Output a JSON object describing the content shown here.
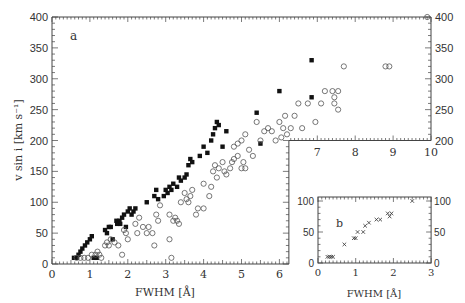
{
  "chart_data": [
    {
      "panel": "a",
      "type": "scatter",
      "xlabel": "FWHM [Å]",
      "ylabel": "v sin i [km s⁻¹]",
      "xlim": [
        0,
        10
      ],
      "ylim": [
        0,
        400
      ],
      "x_ticks": [
        0,
        1,
        2,
        3,
        4,
        5,
        6,
        7,
        8,
        9,
        10
      ],
      "y_ticks": [
        0,
        50,
        100,
        150,
        200,
        250,
        300,
        350,
        400
      ],
      "grid": false,
      "legend": null,
      "note": "Plot region is L-shaped: lower-left x 0–6.25 for y 0–400, upper-right x 6.25–10 for y 200–400",
      "series": [
        {
          "name": "filled squares",
          "marker": "filled-square",
          "points": [
            [
              0.58,
              10
            ],
            [
              0.65,
              10
            ],
            [
              0.7,
              15
            ],
            [
              0.75,
              20
            ],
            [
              0.8,
              25
            ],
            [
              0.87,
              30
            ],
            [
              0.93,
              35
            ],
            [
              1.0,
              40
            ],
            [
              1.05,
              45
            ],
            [
              1.1,
              10
            ],
            [
              1.18,
              10
            ],
            [
              1.4,
              55
            ],
            [
              1.45,
              50
            ],
            [
              1.5,
              60
            ],
            [
              1.55,
              60
            ],
            [
              1.6,
              40
            ],
            [
              1.7,
              70
            ],
            [
              1.72,
              65
            ],
            [
              1.78,
              70
            ],
            [
              1.8,
              65
            ],
            [
              1.85,
              75
            ],
            [
              1.9,
              80
            ],
            [
              1.95,
              60
            ],
            [
              2.0,
              85
            ],
            [
              2.05,
              90
            ],
            [
              2.1,
              80
            ],
            [
              2.15,
              85
            ],
            [
              2.2,
              90
            ],
            [
              2.5,
              100
            ],
            [
              2.7,
              110
            ],
            [
              2.75,
              120
            ],
            [
              2.8,
              105
            ],
            [
              2.95,
              110
            ],
            [
              3.0,
              120
            ],
            [
              3.05,
              115
            ],
            [
              3.1,
              125
            ],
            [
              3.15,
              120
            ],
            [
              3.2,
              130
            ],
            [
              3.3,
              125
            ],
            [
              3.35,
              140
            ],
            [
              3.4,
              135
            ],
            [
              3.5,
              140
            ],
            [
              3.55,
              145
            ],
            [
              3.6,
              160
            ],
            [
              3.65,
              170
            ],
            [
              3.7,
              165
            ],
            [
              3.9,
              175
            ],
            [
              4.0,
              190
            ],
            [
              4.1,
              180
            ],
            [
              4.2,
              200
            ],
            [
              4.25,
              210
            ],
            [
              4.3,
              220
            ],
            [
              4.35,
              230
            ],
            [
              4.4,
              225
            ],
            [
              4.5,
              190
            ],
            [
              4.6,
              215
            ],
            [
              5.4,
              245
            ],
            [
              5.5,
              195
            ],
            [
              6.0,
              280
            ],
            [
              6.85,
              330
            ],
            [
              6.85,
              270
            ]
          ]
        },
        {
          "name": "open circles",
          "marker": "open-circle",
          "points": [
            [
              0.65,
              10
            ],
            [
              0.75,
              10
            ],
            [
              0.85,
              10
            ],
            [
              0.95,
              10
            ],
            [
              1.05,
              15
            ],
            [
              1.15,
              15
            ],
            [
              1.2,
              20
            ],
            [
              1.25,
              15
            ],
            [
              1.3,
              10
            ],
            [
              1.4,
              30
            ],
            [
              1.45,
              35
            ],
            [
              1.5,
              30
            ],
            [
              1.55,
              40
            ],
            [
              1.65,
              35
            ],
            [
              1.75,
              30
            ],
            [
              1.85,
              15
            ],
            [
              1.9,
              55
            ],
            [
              1.95,
              50
            ],
            [
              2.0,
              40
            ],
            [
              2.2,
              65
            ],
            [
              2.25,
              50
            ],
            [
              2.3,
              75
            ],
            [
              2.4,
              60
            ],
            [
              2.5,
              50
            ],
            [
              2.55,
              60
            ],
            [
              2.65,
              50
            ],
            [
              2.7,
              30
            ],
            [
              2.75,
              80
            ],
            [
              2.8,
              70
            ],
            [
              2.85,
              95
            ],
            [
              3.1,
              80
            ],
            [
              3.1,
              40
            ],
            [
              3.15,
              10
            ],
            [
              3.2,
              70
            ],
            [
              3.25,
              75
            ],
            [
              3.3,
              70
            ],
            [
              3.35,
              65
            ],
            [
              3.4,
              100
            ],
            [
              3.5,
              115
            ],
            [
              3.55,
              105
            ],
            [
              3.6,
              100
            ],
            [
              3.65,
              110
            ],
            [
              3.7,
              120
            ],
            [
              3.8,
              80
            ],
            [
              3.85,
              90
            ],
            [
              4.0,
              90
            ],
            [
              4.0,
              130
            ],
            [
              4.15,
              110
            ],
            [
              4.2,
              125
            ],
            [
              4.25,
              150
            ],
            [
              4.3,
              160
            ],
            [
              4.35,
              140
            ],
            [
              4.4,
              155
            ],
            [
              4.5,
              165
            ],
            [
              4.55,
              150
            ],
            [
              4.6,
              145
            ],
            [
              4.7,
              155
            ],
            [
              4.75,
              165
            ],
            [
              4.8,
              170
            ],
            [
              4.9,
              175
            ],
            [
              5.0,
              155
            ],
            [
              5.05,
              165
            ],
            [
              5.1,
              155
            ],
            [
              4.8,
              190
            ],
            [
              4.9,
              195
            ],
            [
              5.0,
              200
            ],
            [
              5.1,
              210
            ],
            [
              5.2,
              185
            ],
            [
              5.3,
              175
            ],
            [
              5.4,
              230
            ],
            [
              5.5,
              200
            ],
            [
              5.6,
              215
            ],
            [
              5.7,
              220
            ],
            [
              5.8,
              215
            ],
            [
              5.9,
              200
            ],
            [
              6.0,
              230
            ],
            [
              6.05,
              205
            ],
            [
              6.1,
              220
            ],
            [
              6.15,
              240
            ],
            [
              6.2,
              210
            ],
            [
              6.3,
              220
            ],
            [
              6.4,
              240
            ],
            [
              6.5,
              260
            ],
            [
              6.6,
              220
            ],
            [
              6.75,
              260
            ],
            [
              6.95,
              230
            ],
            [
              7.1,
              260
            ],
            [
              7.2,
              280
            ],
            [
              7.4,
              280
            ],
            [
              7.45,
              270
            ],
            [
              7.45,
              260
            ],
            [
              7.55,
              280
            ],
            [
              7.55,
              250
            ],
            [
              7.7,
              320
            ],
            [
              8.8,
              320
            ],
            [
              8.9,
              320
            ],
            [
              9.9,
              400
            ]
          ]
        }
      ]
    },
    {
      "panel": "b",
      "type": "scatter",
      "xlabel": "FWHM [Å]",
      "ylabel": "",
      "xlim": [
        0,
        3
      ],
      "ylim": [
        0,
        110
      ],
      "x_ticks": [
        0,
        1,
        2,
        3
      ],
      "y_ticks": [
        0,
        50,
        100
      ],
      "grid": false,
      "legend": null,
      "series": [
        {
          "name": "crosses",
          "marker": "x",
          "points": [
            [
              0.25,
              10
            ],
            [
              0.3,
              10
            ],
            [
              0.35,
              10
            ],
            [
              0.4,
              10
            ],
            [
              0.7,
              30
            ],
            [
              0.95,
              40
            ],
            [
              1.0,
              40
            ],
            [
              1.05,
              50
            ],
            [
              1.2,
              50
            ],
            [
              1.25,
              60
            ],
            [
              1.35,
              65
            ],
            [
              1.55,
              70
            ],
            [
              1.65,
              70
            ],
            [
              1.85,
              80
            ],
            [
              1.9,
              75
            ],
            [
              1.95,
              80
            ],
            [
              2.5,
              100
            ]
          ]
        }
      ]
    }
  ],
  "labels": {
    "panel_a": "a",
    "panel_b": "b",
    "xlabel_a": "FWHM [Å]",
    "xlabel_b": "FWHM [Å]",
    "ylabel": "v sin i [km s⁻¹]"
  }
}
